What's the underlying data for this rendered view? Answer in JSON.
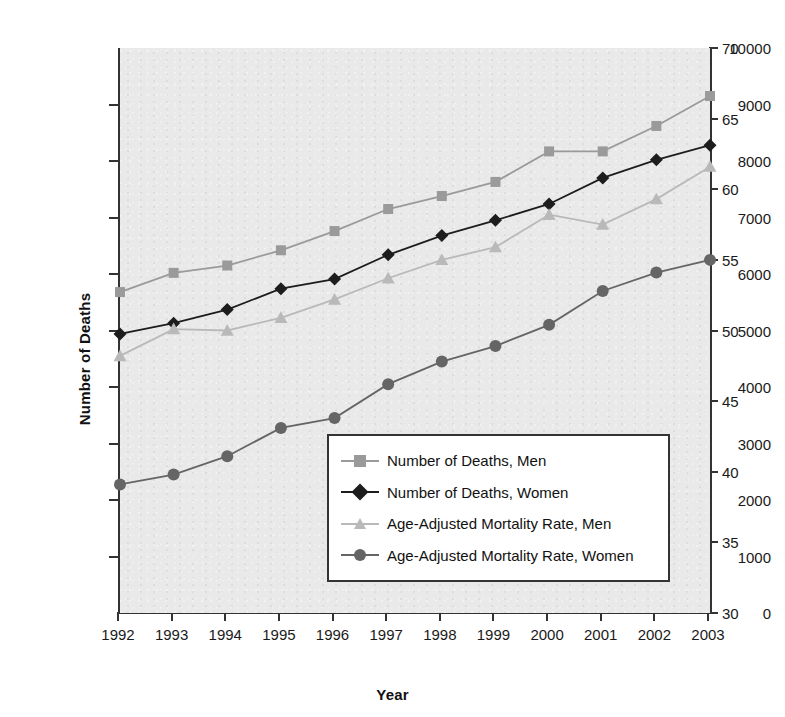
{
  "chart_data": {
    "type": "line",
    "title": "",
    "xlabel": "Year",
    "ylabel": "Number of Deaths",
    "y2label": "Mortality Rate per 1,000,000 Population",
    "categories": [
      "1992",
      "1993",
      "1994",
      "1995",
      "1996",
      "1997",
      "1998",
      "1999",
      "2000",
      "2001",
      "2002",
      "2003"
    ],
    "ylim": [
      0,
      10000
    ],
    "yticks": [
      0,
      1000,
      2000,
      3000,
      4000,
      5000,
      6000,
      7000,
      8000,
      9000,
      10000
    ],
    "y2lim": [
      30,
      70
    ],
    "y2ticks": [
      30,
      35,
      40,
      45,
      50,
      55,
      60,
      65,
      70
    ],
    "grid": false,
    "legend_position": "center-right-inside",
    "series": [
      {
        "name": "Number of Deaths, Men",
        "axis": "left",
        "marker": "square",
        "color": "#9a9a9a",
        "line_color": "#9a9a9a",
        "values": [
          5680,
          6020,
          6150,
          6420,
          6760,
          7150,
          7380,
          7630,
          8170,
          8170,
          8620,
          9150
        ]
      },
      {
        "name": "Number of Deaths, Women",
        "axis": "left",
        "marker": "diamond",
        "color": "#1d1d1d",
        "line_color": "#1d1d1d",
        "values": [
          4940,
          5130,
          5370,
          5740,
          5910,
          6340,
          6680,
          6950,
          7240,
          7700,
          8020,
          8280
        ]
      },
      {
        "name": "Age-Adjusted Mortality Rate, Men",
        "axis": "right",
        "marker": "triangle",
        "color": "#b9b9b9",
        "line_color": "#b9b9b9",
        "values": [
          48.2,
          50.1,
          50.0,
          50.9,
          52.2,
          53.7,
          55.0,
          55.9,
          58.2,
          57.5,
          59.3,
          61.6
        ]
      },
      {
        "name": "Age-Adjusted Mortality Rate, Women",
        "axis": "right",
        "marker": "circle",
        "color": "#656565",
        "line_color": "#656565",
        "values": [
          39.1,
          39.8,
          41.1,
          43.1,
          43.8,
          46.2,
          47.8,
          48.9,
          50.4,
          52.8,
          54.1,
          55.0
        ]
      }
    ]
  },
  "axes": {
    "left_title": "Number of Deaths",
    "right_title": "Mortality Rate per 1,000,000 Population",
    "x_title": "Year"
  },
  "legend": {
    "entries": [
      {
        "label": "Number of Deaths, Men",
        "marker": "square-marker"
      },
      {
        "label": "Number of Deaths, Women",
        "marker": "diamond-marker"
      },
      {
        "label": "Age-Adjusted Mortality Rate, Men",
        "marker": "triangle-marker"
      },
      {
        "label": "Age-Adjusted Mortality Rate, Women",
        "marker": "circle-marker"
      }
    ]
  },
  "colors": {
    "plot_background": "#e9e9e9",
    "axis": "#333333",
    "men_deaths": "#9a9a9a",
    "women_deaths": "#1d1d1d",
    "men_rate": "#b9b9b9",
    "women_rate": "#656565"
  }
}
